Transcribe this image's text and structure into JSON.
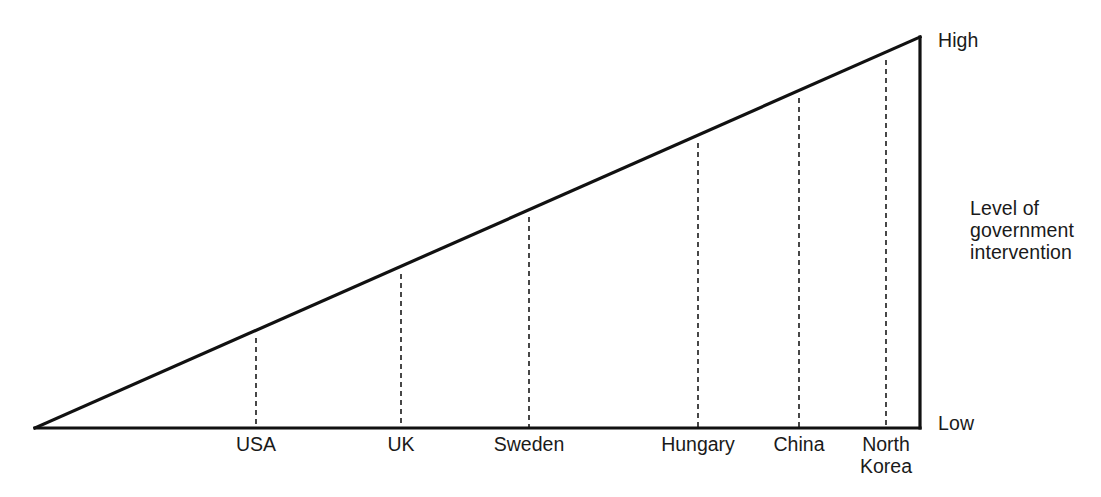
{
  "chart_data": {
    "type": "line",
    "title": "",
    "subtitle": "",
    "xlabel": "",
    "ylabel": "Level of government intervention",
    "axis_annotations": {
      "top": "High",
      "bottom": "Low",
      "side_label_lines": [
        "Level of",
        "government",
        "intervention"
      ]
    },
    "categories": [
      "USA",
      "UK",
      "Sweden",
      "Hungary",
      "China",
      "North Korea"
    ],
    "values": [
      22,
      41,
      58,
      80,
      93,
      100
    ],
    "value_unit": "relative level of government intervention (0 = Low, 100 = High)",
    "series": [
      {
        "name": "Level of government intervention",
        "values": [
          22,
          41,
          58,
          80,
          93,
          100
        ]
      }
    ],
    "ylim": [
      0,
      100
    ],
    "grid": false,
    "legend": null
  },
  "geometry": {
    "apex_x": 35,
    "apex_y": 428,
    "right_x": 920,
    "top_y": 37,
    "baseline_y": 428,
    "stroke_color": "#111111",
    "stroke_width": 3.2,
    "dash_color": "#1a1a1a",
    "dash_width": 1.6,
    "dash_pattern": "5 4",
    "background": "#ffffff"
  },
  "markers": [
    {
      "id": "usa",
      "label": "USA",
      "x": 256,
      "top_y": 338
    },
    {
      "id": "uk",
      "label": "UK",
      "x": 401,
      "top_y": 274
    },
    {
      "id": "sweden",
      "label": "Sweden",
      "x": 529,
      "top_y": 217
    },
    {
      "id": "hungary",
      "label": "Hungary",
      "x": 698,
      "top_y": 143
    },
    {
      "id": "china",
      "label": "China",
      "x": 799,
      "top_y": 98
    },
    {
      "id": "north-korea",
      "label": "North\nKorea",
      "x": 886,
      "top_y": 60
    }
  ],
  "labels": {
    "high": "High",
    "low": "Low",
    "level_line_1": "Level of",
    "level_line_2": "government",
    "level_line_3": "intervention"
  }
}
